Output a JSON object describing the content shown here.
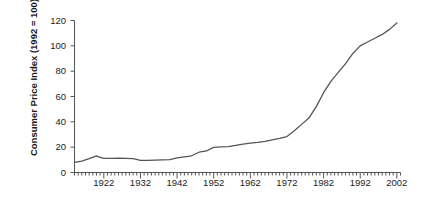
{
  "chart_data": {
    "type": "line",
    "title": "",
    "xlabel": "",
    "ylabel": "Consumer Price Index (1992 = 100)",
    "xlim": [
      1914,
      2003
    ],
    "ylim": [
      0,
      120
    ],
    "grid": false,
    "legend": "none",
    "line_color": "#555555",
    "axis_color": "#555555",
    "text_color": "#222222",
    "background": "#ffffff",
    "ytick_labels": [
      "0",
      "20",
      "40",
      "60",
      "80",
      "100",
      "120"
    ],
    "ytick_values": [
      0,
      20,
      40,
      60,
      80,
      100,
      120
    ],
    "xtick_labels": [
      "1922",
      "1932",
      "1942",
      "1952",
      "1962",
      "1972",
      "1982",
      "1992",
      "2002"
    ],
    "xtick_values": [
      1922,
      1932,
      1942,
      1952,
      1962,
      1972,
      1982,
      1992,
      2002
    ],
    "minor_xtick_interval": 1,
    "x": [
      1914,
      1916,
      1918,
      1920,
      1921,
      1922,
      1924,
      1926,
      1928,
      1930,
      1932,
      1934,
      1936,
      1938,
      1940,
      1942,
      1944,
      1946,
      1948,
      1950,
      1952,
      1954,
      1956,
      1958,
      1960,
      1962,
      1964,
      1966,
      1968,
      1970,
      1972,
      1974,
      1976,
      1978,
      1980,
      1982,
      1984,
      1986,
      1988,
      1990,
      1992,
      1994,
      1996,
      1998,
      2000,
      2002
    ],
    "values": [
      8.0,
      9.0,
      11.0,
      13.2,
      12.0,
      11.2,
      11.2,
      11.3,
      11.2,
      11.0,
      9.6,
      9.6,
      9.8,
      10.0,
      10.2,
      11.5,
      12.4,
      13.2,
      16.0,
      17.0,
      19.8,
      20.2,
      20.4,
      21.4,
      22.4,
      23.2,
      23.8,
      24.6,
      25.8,
      27.0,
      28.4,
      33.0,
      38.0,
      43.0,
      52.0,
      63.0,
      72.0,
      79.0,
      86.0,
      94.0,
      100.0,
      103.0,
      106.0,
      109.0,
      113.0,
      118.0
    ],
    "series_name": "Consumer Price Index"
  },
  "axis": {
    "y_title": "Consumer Price Index (1992 = 100)"
  }
}
